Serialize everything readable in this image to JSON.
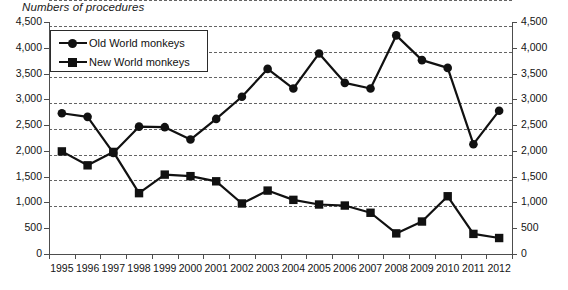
{
  "chart_data": {
    "type": "line",
    "title": "Numbers of procedures",
    "xlabel": "",
    "ylabel": "",
    "ylim": [
      0,
      4500
    ],
    "ytick_step": 500,
    "grid": true,
    "dual_axis": true,
    "legend_position": "top-left",
    "categories": [
      "1995",
      "1996",
      "1997",
      "1998",
      "1999",
      "2000",
      "2001",
      "2002",
      "2003",
      "2004",
      "2005",
      "2006",
      "2007",
      "2008",
      "2009",
      "2010",
      "2011",
      "2012"
    ],
    "yticks": [
      "0",
      "500",
      "1,000",
      "1,500",
      "2,000",
      "2,500",
      "3,000",
      "3,500",
      "4,000",
      "4,500"
    ],
    "series": [
      {
        "name": "Old World monkeys",
        "marker": "circle",
        "color": "#111111",
        "values": [
          2730,
          2660,
          1960,
          2470,
          2460,
          2220,
          2620,
          3050,
          3590,
          3210,
          3890,
          3320,
          3210,
          4240,
          3760,
          3610,
          2130,
          2780
        ]
      },
      {
        "name": "New World monkeys",
        "marker": "square",
        "color": "#111111",
        "values": [
          1990,
          1720,
          1980,
          1180,
          1540,
          1510,
          1410,
          980,
          1230,
          1050,
          960,
          940,
          800,
          400,
          630,
          1120,
          390,
          310
        ]
      }
    ]
  }
}
